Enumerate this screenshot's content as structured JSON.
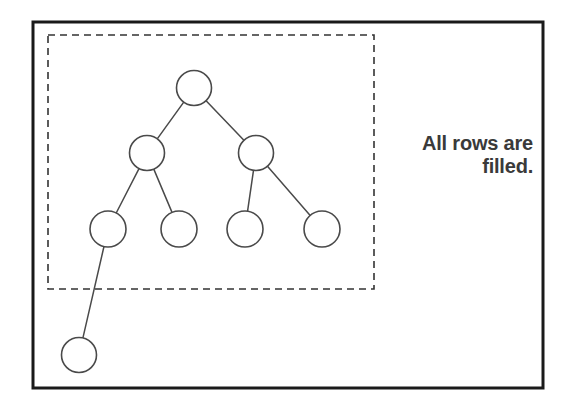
{
  "figure": {
    "background_color": "#ffffff",
    "outer_frame": {
      "name": "outer-border",
      "x": 33,
      "y": 22,
      "width": 510,
      "height": 366,
      "stroke_color": "#1a1a1a",
      "stroke_width": 3,
      "style": "solid"
    },
    "dashed_region": {
      "name": "filled-rows-region",
      "x": 48,
      "y": 35,
      "width": 326,
      "height": 254,
      "stroke_color": "#333333",
      "stroke_width": 1.6,
      "style": "dashed",
      "dash_pattern": "7 5"
    },
    "node_style": {
      "fill": "#ffffff",
      "stroke_color": "#4a4a4a",
      "stroke_width": 1.6,
      "radius": 17.5
    },
    "edge_style": {
      "stroke_color": "#4a4a4a",
      "stroke_width": 1.5
    },
    "nodes": [
      {
        "id": "root",
        "level": 0,
        "cx": 194,
        "cy": 88,
        "r": 17.5,
        "inside_dashed_region": true,
        "label": ""
      },
      {
        "id": "n2",
        "level": 1,
        "cx": 147,
        "cy": 153,
        "r": 17.5,
        "inside_dashed_region": true,
        "label": ""
      },
      {
        "id": "n3",
        "level": 1,
        "cx": 256,
        "cy": 153,
        "r": 17.5,
        "inside_dashed_region": true,
        "label": ""
      },
      {
        "id": "n4",
        "level": 2,
        "cx": 108,
        "cy": 229,
        "r": 18,
        "inside_dashed_region": true,
        "label": ""
      },
      {
        "id": "n5",
        "level": 2,
        "cx": 179,
        "cy": 229,
        "r": 18,
        "inside_dashed_region": true,
        "label": ""
      },
      {
        "id": "n6",
        "level": 2,
        "cx": 245,
        "cy": 229,
        "r": 18,
        "inside_dashed_region": true,
        "label": ""
      },
      {
        "id": "n7",
        "level": 2,
        "cx": 322,
        "cy": 229,
        "r": 18,
        "inside_dashed_region": true,
        "label": ""
      },
      {
        "id": "n8",
        "level": 3,
        "cx": 79,
        "cy": 355,
        "r": 17.5,
        "inside_dashed_region": false,
        "label": ""
      }
    ],
    "edges": [
      {
        "from": "root",
        "to": "n2"
      },
      {
        "from": "root",
        "to": "n3"
      },
      {
        "from": "n2",
        "to": "n4"
      },
      {
        "from": "n2",
        "to": "n5"
      },
      {
        "from": "n3",
        "to": "n6"
      },
      {
        "from": "n3",
        "to": "n7"
      },
      {
        "from": "n4",
        "to": "n8"
      }
    ]
  },
  "caption": {
    "text": "All rows are\nfilled.",
    "line1": "All rows are",
    "line2": "filled.",
    "color": "#3a3a3a",
    "align": "right"
  }
}
